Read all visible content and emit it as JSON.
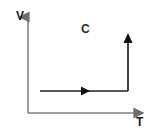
{
  "diagram": {
    "name": "volume-temperature-process-diagram",
    "background_color": "#ffffff",
    "axes": {
      "color": "#808080",
      "vertical": {
        "label": "V",
        "label_x": 16,
        "label_y": 20,
        "x": 28,
        "y_top": 14,
        "y_bottom": 113,
        "arrow": "arrow-up"
      },
      "horizontal": {
        "label": "T",
        "label_x": 136,
        "label_y": 126,
        "y": 113,
        "x_left": 28,
        "x_right": 146,
        "arrow": "arrow-right"
      }
    },
    "process": {
      "label": "C",
      "label_x": 81,
      "label_y": 33,
      "color": "#222222",
      "segments": [
        {
          "name": "isobaric-expansion-segment",
          "direction": "right",
          "x_start": 40,
          "x_end": 128,
          "y": 91,
          "arrow_at": 85
        },
        {
          "name": "isothermal-rise-segment",
          "direction": "up",
          "x": 128,
          "y_start": 91,
          "y_end": 34,
          "arrow_at": 34
        }
      ]
    }
  }
}
